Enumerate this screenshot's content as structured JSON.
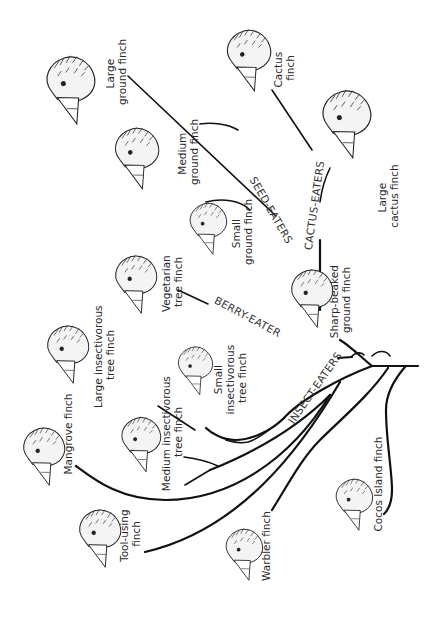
{
  "diagram": {
    "groups": {
      "seed_eaters": "SEED-EATERS",
      "cactus_eaters": "CACTUS-EATERS",
      "berry_eater": "BERRY-EATER",
      "insect_eaters": "INSECT-EATERS"
    },
    "finches": [
      {
        "id": "large-ground",
        "line1": "Large",
        "line2": "ground finch"
      },
      {
        "id": "cactus",
        "line1": "Cactus",
        "line2": "finch"
      },
      {
        "id": "medium-ground",
        "line1": "Medium",
        "line2": "ground finch"
      },
      {
        "id": "large-cactus",
        "line1": "Large",
        "line2": "cactus finch"
      },
      {
        "id": "small-ground",
        "line1": "Small",
        "line2": "ground finch"
      },
      {
        "id": "sharp-beaked",
        "line1": "Sharp-beaked",
        "line2": "ground finch"
      },
      {
        "id": "vegetarian",
        "line1": "Vegetarian",
        "line2": "tree finch"
      },
      {
        "id": "large-insectivorous",
        "line1": "Large insectivorous",
        "line2": "tree finch"
      },
      {
        "id": "small-insectivorous",
        "line1": "Small",
        "line2": "insectivorous",
        "line3": "tree finch"
      },
      {
        "id": "medium-insectivorous",
        "line1": "Medium insectivorous",
        "line2": "tree finch"
      },
      {
        "id": "mangrove",
        "line1": "Mangrove finch"
      },
      {
        "id": "tool-using",
        "line1": "Tool-using",
        "line2": "finch"
      },
      {
        "id": "warbler",
        "line1": "Warbler finch"
      },
      {
        "id": "cocos-island",
        "line1": "Cocos Island finch"
      }
    ]
  }
}
